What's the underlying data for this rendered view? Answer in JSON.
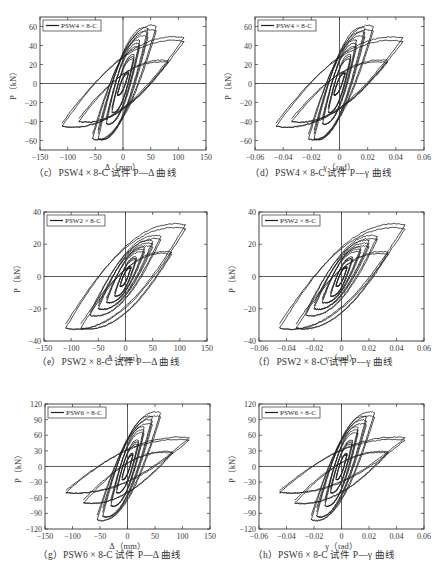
{
  "chart_data": [
    {
      "id": "c",
      "type": "line",
      "title": "(c) PSW4×8-C 试件 P—Δ 曲线",
      "caption": "（c）PSW4 × 8-C 试件 P—Δ 曲线",
      "legend": "PSW4 × 8-C",
      "xlabel": "Δ（mm）",
      "ylabel": "P（kN）",
      "xlim": [
        -150,
        150
      ],
      "ylim": [
        -70,
        70
      ],
      "xticks": [
        -150,
        -100,
        -50,
        0,
        50,
        100,
        150
      ],
      "yticks": [
        -60,
        -40,
        -20,
        0,
        20,
        40,
        60
      ],
      "yticklabels": [
        "-60",
        "-40",
        "-20",
        "0",
        "20",
        "40",
        "60"
      ],
      "xticklabels": [
        "-150",
        "-100",
        "-50",
        "0",
        "50",
        "100",
        "150"
      ],
      "grid": false,
      "legend_position": "upper left",
      "loops": [
        {
          "xmax": 10,
          "pmax": 12,
          "xmin": -10,
          "pmin": -12
        },
        {
          "xmax": 20,
          "pmax": 30,
          "xmin": -20,
          "pmin": -30
        },
        {
          "xmax": 30,
          "pmax": 45,
          "xmin": -30,
          "pmin": -42
        },
        {
          "xmax": 45,
          "pmax": 58,
          "xmin": -45,
          "pmin": -58
        },
        {
          "xmax": 60,
          "pmax": 60,
          "xmin": -55,
          "pmin": -58
        },
        {
          "xmax": 82,
          "pmax": 24,
          "xmin": -80,
          "pmin": -40
        },
        {
          "xmax": 110,
          "pmax": 48,
          "xmin": -110,
          "pmin": -45
        }
      ],
      "peak_positive": {
        "x": 55,
        "y": 60
      },
      "peak_negative": {
        "x": -55,
        "y": -59
      }
    },
    {
      "id": "d",
      "type": "line",
      "title": "(d) PSW4×8-C 试件 P—γ 曲线",
      "caption": "（d）PSW4 × 8-C 试件 P—γ 曲线",
      "legend": "PSW4 × 8-C",
      "xlabel": "γ（rad）",
      "ylabel": "P（kN）",
      "xlim": [
        -0.06,
        0.06
      ],
      "ylim": [
        -70,
        70
      ],
      "xticks": [
        -0.06,
        -0.04,
        -0.02,
        0,
        0.02,
        0.04,
        0.06
      ],
      "yticks": [
        -60,
        -40,
        -20,
        0,
        20,
        40,
        60
      ],
      "yticklabels": [
        "-60",
        "-40",
        "-20",
        "0",
        "20",
        "40",
        "60"
      ],
      "xticklabels": [
        "-0.06",
        "-0.04",
        "-0.02",
        "0",
        "0.02",
        "0.04",
        "0.06"
      ],
      "grid": false,
      "legend_position": "upper left",
      "loops": [
        {
          "xmax": 0.004,
          "pmax": 12,
          "xmin": -0.004,
          "pmin": -12
        },
        {
          "xmax": 0.008,
          "pmax": 30,
          "xmin": -0.008,
          "pmin": -30
        },
        {
          "xmax": 0.012,
          "pmax": 45,
          "xmin": -0.012,
          "pmin": -42
        },
        {
          "xmax": 0.018,
          "pmax": 58,
          "xmin": -0.018,
          "pmin": -58
        },
        {
          "xmax": 0.024,
          "pmax": 60,
          "xmin": -0.022,
          "pmin": -58
        },
        {
          "xmax": 0.034,
          "pmax": 24,
          "xmin": -0.034,
          "pmin": -40
        },
        {
          "xmax": 0.045,
          "pmax": 48,
          "xmin": -0.045,
          "pmin": -45
        }
      ],
      "peak_positive": {
        "x": 0.022,
        "y": 60
      },
      "peak_negative": {
        "x": -0.022,
        "y": -59
      }
    },
    {
      "id": "e",
      "type": "line",
      "title": "(e) PSW2×8-C 试件 P—Δ 曲线",
      "caption": "（e）PSW2 × 8-C 试件 P—Δ 曲线",
      "legend": "PSW2 × 8-C",
      "xlabel": "Δ（mm）",
      "ylabel": "P（kN）",
      "xlim": [
        -150,
        150
      ],
      "ylim": [
        -40,
        40
      ],
      "xticks": [
        -150,
        -100,
        -50,
        0,
        50,
        100,
        150
      ],
      "yticks": [
        -40,
        -20,
        0,
        20,
        40
      ],
      "yticklabels": [
        "-40",
        "-20",
        "0",
        "20",
        "40"
      ],
      "xticklabels": [
        "-150",
        "-100",
        "-50",
        "0",
        "50",
        "100",
        "150"
      ],
      "grid": false,
      "legend_position": "upper left",
      "loops": [
        {
          "xmax": 10,
          "pmax": 6,
          "xmin": -10,
          "pmin": -6
        },
        {
          "xmax": 20,
          "pmax": 12,
          "xmin": -20,
          "pmin": -12
        },
        {
          "xmax": 35,
          "pmax": 18,
          "xmin": -35,
          "pmin": -16
        },
        {
          "xmax": 50,
          "pmax": 22,
          "xmin": -50,
          "pmin": -20
        },
        {
          "xmax": 65,
          "pmax": 25,
          "xmin": -65,
          "pmin": -24
        },
        {
          "xmax": 85,
          "pmax": 15,
          "xmin": -82,
          "pmin": -32
        },
        {
          "xmax": 110,
          "pmax": 32,
          "xmin": -110,
          "pmin": -32
        }
      ],
      "peak_positive": {
        "x": 110,
        "y": 32
      },
      "peak_negative": {
        "x": -110,
        "y": -32
      }
    },
    {
      "id": "f",
      "type": "line",
      "title": "(f) PSW2×8-C 试件 P—γ 曲线",
      "caption": "（f）PSW2 × 8-C 试件 P—γ 曲线",
      "legend": "PSW2 × 8-C",
      "xlabel": "γ（rad）",
      "ylabel": "P（kN）",
      "xlim": [
        -0.06,
        0.06
      ],
      "ylim": [
        -40,
        40
      ],
      "xticks": [
        -0.06,
        -0.04,
        -0.02,
        0,
        0.02,
        0.04,
        0.06
      ],
      "yticks": [
        -40,
        -20,
        0,
        20,
        40
      ],
      "yticklabels": [
        "-40",
        "-20",
        "0",
        "20",
        "40"
      ],
      "xticklabels": [
        "-0.06",
        "-0.04",
        "-0.02",
        "0",
        "0.02",
        "0.04",
        "0.06"
      ],
      "grid": false,
      "legend_position": "upper left",
      "loops": [
        {
          "xmax": 0.004,
          "pmax": 6,
          "xmin": -0.004,
          "pmin": -6
        },
        {
          "xmax": 0.008,
          "pmax": 12,
          "xmin": -0.008,
          "pmin": -12
        },
        {
          "xmax": 0.014,
          "pmax": 18,
          "xmin": -0.014,
          "pmin": -16
        },
        {
          "xmax": 0.02,
          "pmax": 22,
          "xmin": -0.02,
          "pmin": -20
        },
        {
          "xmax": 0.026,
          "pmax": 25,
          "xmin": -0.026,
          "pmin": -24
        },
        {
          "xmax": 0.034,
          "pmax": 15,
          "xmin": -0.033,
          "pmin": -32
        },
        {
          "xmax": 0.046,
          "pmax": 32,
          "xmin": -0.045,
          "pmin": -32
        }
      ],
      "peak_positive": {
        "x": 0.046,
        "y": 32
      },
      "peak_negative": {
        "x": -0.045,
        "y": -32
      }
    },
    {
      "id": "g",
      "type": "line",
      "title": "(g) PSW6×8-C 试件 P—Δ 曲线",
      "caption": "（g）PSW6 × 8-C 试件 P—Δ 曲线",
      "legend": "PSW6 × 8-C",
      "xlabel": "Δ（mm）",
      "ylabel": "P（kN）",
      "xlim": [
        -150,
        150
      ],
      "ylim": [
        -120,
        120
      ],
      "xticks": [
        -150,
        -100,
        -50,
        0,
        50,
        100,
        150
      ],
      "yticks": [
        -120,
        -90,
        -60,
        -30,
        0,
        30,
        60,
        90,
        120
      ],
      "yticklabels": [
        "-120",
        "-90",
        "-60",
        "-30",
        "0",
        "30",
        "60",
        "90",
        "120"
      ],
      "xticklabels": [
        "-150",
        "-100",
        "-50",
        "0",
        "50",
        "100",
        "150"
      ],
      "grid": false,
      "legend_position": "upper left",
      "loops": [
        {
          "xmax": 10,
          "pmax": 25,
          "xmin": -10,
          "pmin": -25
        },
        {
          "xmax": 20,
          "pmax": 50,
          "xmin": -20,
          "pmin": -50
        },
        {
          "xmax": 30,
          "pmax": 75,
          "xmin": -30,
          "pmin": -75
        },
        {
          "xmax": 45,
          "pmax": 95,
          "xmin": -45,
          "pmin": -95
        },
        {
          "xmax": 60,
          "pmax": 103,
          "xmin": -55,
          "pmin": -102
        },
        {
          "xmax": 82,
          "pmax": 28,
          "xmin": -80,
          "pmin": -70
        },
        {
          "xmax": 112,
          "pmax": 55,
          "xmin": -112,
          "pmin": -50
        }
      ],
      "peak_positive": {
        "x": 55,
        "y": 104
      },
      "peak_negative": {
        "x": -55,
        "y": -103
      }
    },
    {
      "id": "h",
      "type": "line",
      "title": "(h) PSW6×8-C 试件 P—γ 曲线",
      "caption": "（h）PSW6 × 8-C 试件 P—γ 曲线",
      "legend": "PSW6 × 8-C",
      "xlabel": "γ（rad）",
      "ylabel": "P（kN）",
      "xlim": [
        -0.06,
        0.06
      ],
      "ylim": [
        -120,
        120
      ],
      "xticks": [
        -0.06,
        -0.04,
        -0.02,
        0,
        0.02,
        0.04,
        0.06
      ],
      "yticks": [
        -120,
        -90,
        -60,
        -30,
        0,
        30,
        60,
        90,
        120
      ],
      "yticklabels": [
        "-120",
        "-90",
        "-60",
        "-30",
        "0",
        "30",
        "60",
        "90",
        "120"
      ],
      "xticklabels": [
        "-0.06",
        "-0.04",
        "-0.02",
        "0",
        "0.02",
        "0.04",
        "0.06"
      ],
      "grid": false,
      "legend_position": "upper left",
      "loops": [
        {
          "xmax": 0.004,
          "pmax": 25,
          "xmin": -0.004,
          "pmin": -25
        },
        {
          "xmax": 0.008,
          "pmax": 50,
          "xmin": -0.008,
          "pmin": -50
        },
        {
          "xmax": 0.012,
          "pmax": 75,
          "xmin": -0.012,
          "pmin": -75
        },
        {
          "xmax": 0.018,
          "pmax": 95,
          "xmin": -0.018,
          "pmin": -95
        },
        {
          "xmax": 0.024,
          "pmax": 103,
          "xmin": -0.022,
          "pmin": -102
        },
        {
          "xmax": 0.034,
          "pmax": 28,
          "xmin": -0.034,
          "pmin": -70
        },
        {
          "xmax": 0.046,
          "pmax": 55,
          "xmin": -0.045,
          "pmin": -50
        }
      ],
      "peak_positive": {
        "x": 0.022,
        "y": 104
      },
      "peak_negative": {
        "x": -0.022,
        "y": -103
      }
    }
  ],
  "layout": {
    "panels": [
      {
        "id": "c",
        "box": [
          40,
          17,
          206,
          150
        ],
        "caption_pos": [
          34,
          174
        ]
      },
      {
        "id": "d",
        "box": [
          255,
          17,
          424,
          150
        ],
        "caption_pos": [
          250,
          174
        ]
      },
      {
        "id": "e",
        "box": [
          44,
          212,
          207,
          341
        ],
        "caption_pos": [
          37,
          363
        ]
      },
      {
        "id": "f",
        "box": [
          259,
          212,
          424,
          341
        ],
        "caption_pos": [
          253,
          363
        ]
      },
      {
        "id": "g",
        "box": [
          45,
          404,
          210,
          529
        ],
        "caption_pos": [
          38,
          556
        ]
      },
      {
        "id": "h",
        "box": [
          259,
          404,
          424,
          529
        ],
        "caption_pos": [
          253,
          556
        ]
      }
    ],
    "line_color": "#1e1e1e",
    "axis_color": "#333333"
  }
}
